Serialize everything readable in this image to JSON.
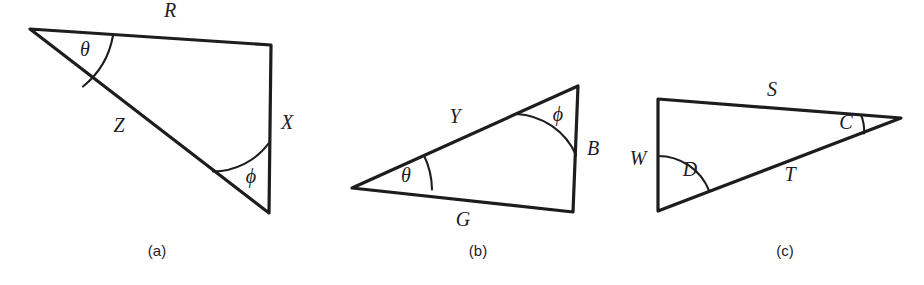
{
  "figure": {
    "background_color": "#ffffff",
    "stroke_color": "#1d1d1f",
    "panels": [
      {
        "id": "panel-a",
        "caption": "(a)",
        "caption_x": 157,
        "caption_y": 252,
        "vertices": {
          "apex_left": [
            30,
            29
          ],
          "top_right": [
            271,
            45
          ],
          "bottom_right": [
            269,
            213
          ]
        },
        "sides": [
          {
            "name": "R",
            "label": "R",
            "label_x": 170,
            "label_y": 12,
            "from": "apex_left",
            "to": "top_right"
          },
          {
            "name": "X",
            "label": "X",
            "label_x": 287,
            "label_y": 124,
            "from": "top_right",
            "to": "bottom_right"
          },
          {
            "name": "Z",
            "label": "Z",
            "label_x": 119,
            "label_y": 127,
            "from": "apex_left",
            "to": "bottom_right"
          }
        ],
        "angles": [
          {
            "name": "theta",
            "label": "θ",
            "label_x": 85,
            "label_y": 51,
            "at": "apex_left"
          },
          {
            "name": "phi",
            "label": "ϕ",
            "label_x": 251,
            "label_y": 178,
            "at": "bottom_right"
          }
        ]
      },
      {
        "id": "panel-b",
        "caption": "(b)",
        "caption_x": 478,
        "caption_y": 252,
        "vertices": {
          "apex_left": [
            352,
            188
          ],
          "top_right": [
            578,
            86
          ],
          "bottom_right": [
            573,
            212
          ]
        },
        "sides": [
          {
            "name": "Y",
            "label": "Y",
            "label_x": 455,
            "label_y": 118,
            "from": "apex_left",
            "to": "top_right"
          },
          {
            "name": "B",
            "label": "B",
            "label_x": 593,
            "label_y": 150,
            "from": "top_right",
            "to": "bottom_right"
          },
          {
            "name": "G",
            "label": "G",
            "label_x": 463,
            "label_y": 221,
            "from": "apex_left",
            "to": "bottom_right"
          }
        ],
        "angles": [
          {
            "name": "theta",
            "label": "θ",
            "label_x": 406,
            "label_y": 177,
            "at": "apex_left"
          },
          {
            "name": "phi",
            "label": "ϕ",
            "label_x": 558,
            "label_y": 116,
            "at": "top_right"
          }
        ]
      },
      {
        "id": "panel-c",
        "caption": "(c)",
        "caption_x": 785,
        "caption_y": 252,
        "vertices": {
          "top_left": [
            658,
            99
          ],
          "bottom_left": [
            658,
            211
          ],
          "right": [
            901,
            118
          ]
        },
        "sides": [
          {
            "name": "S",
            "label": "S",
            "label_x": 772,
            "label_y": 91,
            "from": "top_left",
            "to": "right"
          },
          {
            "name": "W",
            "label": "W",
            "label_x": 638,
            "label_y": 160,
            "from": "top_left",
            "to": "bottom_left"
          },
          {
            "name": "T",
            "label": "T",
            "label_x": 790,
            "label_y": 176,
            "from": "bottom_left",
            "to": "right"
          }
        ],
        "angles": [
          {
            "name": "C",
            "label": "C",
            "label_x": 846,
            "label_y": 124,
            "at": "right"
          },
          {
            "name": "D",
            "label": "D",
            "label_x": 690,
            "label_y": 171,
            "at": "bottom_left"
          }
        ]
      }
    ]
  }
}
